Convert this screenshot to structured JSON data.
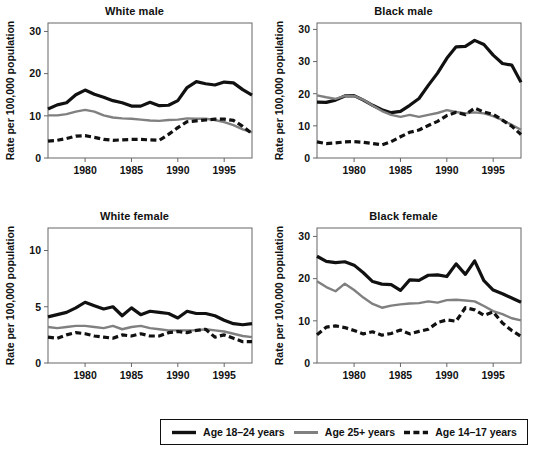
{
  "figure": {
    "y_axis_label": "Rate per 100,000 population",
    "x_ticks": [
      1980,
      1985,
      1990,
      1995
    ],
    "x_range": [
      1976,
      1998
    ]
  },
  "legend": {
    "items": [
      {
        "label": "Age 18–24 years",
        "style": "solid",
        "color": "#111111",
        "width": 3.2
      },
      {
        "label": "Age 25+ years",
        "style": "solid",
        "color": "#808080",
        "width": 2.4
      },
      {
        "label": "Age 14–17 years",
        "style": "dashed",
        "color": "#111111",
        "width": 3.2
      }
    ]
  },
  "chart_data": [
    {
      "type": "line",
      "title": "White male",
      "xlabel": "",
      "ylabel": "Rate per 100,000 population",
      "xlim": [
        1976,
        1998
      ],
      "ylim": [
        0,
        32
      ],
      "yticks": [
        0,
        10,
        20,
        30
      ],
      "xticks": [
        1980,
        1985,
        1990,
        1995
      ],
      "grid": false,
      "x": [
        1976,
        1977,
        1978,
        1979,
        1980,
        1981,
        1982,
        1983,
        1984,
        1985,
        1986,
        1987,
        1988,
        1989,
        1990,
        1991,
        1992,
        1993,
        1994,
        1995,
        1996,
        1997,
        1998
      ],
      "series": [
        {
          "name": "Age 18–24 years",
          "style": "solid",
          "color": "#111111",
          "values": [
            11.6,
            12.6,
            13.1,
            15.0,
            16.1,
            15.1,
            14.4,
            13.6,
            13.1,
            12.3,
            12.3,
            13.2,
            12.4,
            12.5,
            13.6,
            16.7,
            18.1,
            17.6,
            17.3,
            18.0,
            17.8,
            16.2,
            14.9
          ]
        },
        {
          "name": "Age 25+ years",
          "style": "solid",
          "color": "#808080",
          "values": [
            10.1,
            10.1,
            10.4,
            11.0,
            11.4,
            11.0,
            10.1,
            9.6,
            9.4,
            9.3,
            9.1,
            8.9,
            8.8,
            9.0,
            9.1,
            9.4,
            9.3,
            9.3,
            9.0,
            8.5,
            7.8,
            6.8,
            6.1
          ]
        },
        {
          "name": "Age 14–17 years",
          "style": "dashed",
          "color": "#111111",
          "values": [
            4.0,
            4.2,
            4.6,
            5.2,
            5.3,
            4.9,
            4.4,
            4.2,
            4.3,
            4.4,
            4.4,
            4.3,
            4.2,
            5.6,
            7.2,
            8.6,
            8.8,
            9.0,
            9.2,
            9.2,
            8.9,
            7.5,
            5.8
          ]
        }
      ]
    },
    {
      "type": "line",
      "title": "Black male",
      "xlabel": "",
      "ylabel": "Rate per 100,000 population",
      "xlim": [
        1976,
        1998
      ],
      "ylim": [
        0,
        42
      ],
      "yticks": [
        0,
        10,
        20,
        30,
        40
      ],
      "ytick_labels": [
        "0",
        "10",
        "20",
        "30",
        "30"
      ],
      "xticks": [
        1980,
        1985,
        1990,
        1995
      ],
      "grid": false,
      "x": [
        1976,
        1977,
        1978,
        1979,
        1980,
        1981,
        1982,
        1983,
        1984,
        1985,
        1986,
        1987,
        1988,
        1989,
        1990,
        1991,
        1992,
        1993,
        1994,
        1995,
        1996,
        1997,
        1998
      ],
      "series": [
        {
          "name": "Age 18–24 years",
          "style": "solid",
          "color": "#111111",
          "values": [
            17.4,
            17.3,
            18.0,
            19.3,
            19.4,
            18.0,
            16.4,
            15.0,
            14.1,
            14.5,
            16.4,
            18.5,
            22.6,
            26.4,
            31.0,
            34.6,
            34.7,
            36.6,
            35.3,
            32.0,
            29.4,
            28.9,
            23.6
          ]
        },
        {
          "name": "Age 25+ years",
          "style": "solid",
          "color": "#808080",
          "values": [
            19.5,
            18.9,
            18.4,
            19.3,
            19.3,
            18.1,
            16.3,
            14.6,
            13.4,
            12.8,
            13.4,
            12.8,
            13.4,
            14.0,
            14.9,
            14.3,
            13.9,
            14.2,
            13.9,
            13.0,
            11.8,
            10.3,
            8.8
          ]
        },
        {
          "name": "Age 14–17 years",
          "style": "dashed",
          "color": "#111111",
          "values": [
            5.0,
            4.5,
            4.7,
            5.0,
            5.1,
            4.9,
            4.5,
            4.1,
            5.1,
            6.6,
            8.0,
            8.7,
            10.1,
            11.4,
            13.2,
            14.2,
            13.5,
            15.5,
            14.3,
            13.6,
            11.8,
            9.9,
            7.3
          ]
        }
      ]
    },
    {
      "type": "line",
      "title": "White female",
      "xlabel": "",
      "ylabel": "Rate per 100,000 population",
      "xlim": [
        1976,
        1998
      ],
      "ylim": [
        0,
        12
      ],
      "yticks": [
        0,
        5,
        10
      ],
      "xticks": [
        1980,
        1985,
        1990,
        1995
      ],
      "grid": false,
      "x": [
        1976,
        1977,
        1978,
        1979,
        1980,
        1981,
        1982,
        1983,
        1984,
        1985,
        1986,
        1987,
        1988,
        1989,
        1990,
        1991,
        1992,
        1993,
        1994,
        1995,
        1996,
        1997,
        1998
      ],
      "series": [
        {
          "name": "Age 18–24 years",
          "style": "solid",
          "color": "#111111",
          "values": [
            4.1,
            4.3,
            4.5,
            4.9,
            5.4,
            5.1,
            4.8,
            5.0,
            4.2,
            4.9,
            4.3,
            4.6,
            4.5,
            4.4,
            4.0,
            4.6,
            4.4,
            4.4,
            4.2,
            3.8,
            3.5,
            3.4,
            3.5
          ]
        },
        {
          "name": "Age 25+ years",
          "style": "solid",
          "color": "#808080",
          "values": [
            3.2,
            3.1,
            3.2,
            3.3,
            3.3,
            3.2,
            3.1,
            3.3,
            3.0,
            3.2,
            3.3,
            3.1,
            3.0,
            2.9,
            2.9,
            2.9,
            2.9,
            3.0,
            2.9,
            2.8,
            2.6,
            2.4,
            2.3
          ]
        },
        {
          "name": "Age 14–17 years",
          "style": "dashed",
          "color": "#111111",
          "values": [
            2.3,
            2.2,
            2.5,
            2.7,
            2.6,
            2.4,
            2.3,
            2.2,
            2.5,
            2.4,
            2.6,
            2.4,
            2.4,
            2.7,
            2.8,
            2.7,
            2.9,
            3.0,
            2.3,
            2.5,
            2.2,
            1.9,
            1.9
          ]
        }
      ]
    },
    {
      "type": "line",
      "title": "Black female",
      "xlabel": "",
      "ylabel": "Rate per 100,000 population",
      "xlim": [
        1976,
        1998
      ],
      "ylim": [
        0,
        32
      ],
      "yticks": [
        0,
        10,
        20,
        30
      ],
      "xticks": [
        1980,
        1985,
        1990,
        1995
      ],
      "grid": false,
      "x": [
        1976,
        1977,
        1978,
        1979,
        1980,
        1981,
        1982,
        1983,
        1984,
        1985,
        1986,
        1987,
        1988,
        1989,
        1990,
        1991,
        1992,
        1993,
        1994,
        1995,
        1996,
        1997,
        1998
      ],
      "series": [
        {
          "name": "Age 18–24 years",
          "style": "solid",
          "color": "#111111",
          "values": [
            25.3,
            24.1,
            23.8,
            24.0,
            23.2,
            21.4,
            19.3,
            18.7,
            18.6,
            17.2,
            19.7,
            19.6,
            20.8,
            20.9,
            20.5,
            23.5,
            21.0,
            24.2,
            19.5,
            17.3,
            16.4,
            15.4,
            14.4
          ]
        },
        {
          "name": "Age 25+ years",
          "style": "solid",
          "color": "#808080",
          "values": [
            19.4,
            18.0,
            17.0,
            18.8,
            17.3,
            15.5,
            14.0,
            13.1,
            13.6,
            13.9,
            14.1,
            14.2,
            14.6,
            14.3,
            14.9,
            15.0,
            14.8,
            14.6,
            13.5,
            12.3,
            11.6,
            10.6,
            10.1
          ]
        },
        {
          "name": "Age 14–17 years",
          "style": "dashed",
          "color": "#111111",
          "values": [
            6.7,
            8.5,
            8.8,
            8.4,
            7.7,
            6.9,
            7.4,
            6.6,
            7.0,
            7.8,
            6.9,
            7.5,
            8.0,
            9.6,
            10.2,
            9.9,
            13.1,
            12.6,
            11.3,
            12.1,
            9.5,
            7.7,
            6.3
          ]
        }
      ]
    }
  ]
}
